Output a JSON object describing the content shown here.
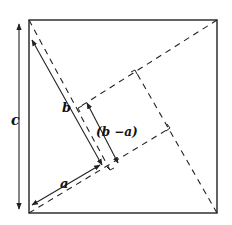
{
  "diagram": {
    "labels": {
      "c": "c",
      "b": "b",
      "a": "a",
      "b_minus_a": "(b −a)"
    },
    "colors": {
      "stroke": "#222222",
      "background": "#ffffff"
    },
    "outer_square": {
      "x1": 29,
      "y1": 20,
      "x2": 217,
      "y2": 213
    },
    "inner_square_corners": [
      [
        135,
        70
      ],
      [
        170,
        128
      ],
      [
        110,
        170
      ],
      [
        78,
        108
      ]
    ]
  }
}
